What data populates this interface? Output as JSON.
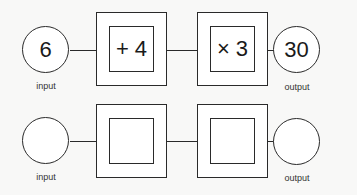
{
  "rows": [
    {
      "input": {
        "value": "6",
        "label": "input"
      },
      "operations": [
        {
          "value": "+ 4"
        },
        {
          "value": "× 3"
        }
      ],
      "output": {
        "value": "30",
        "label": "output"
      }
    },
    {
      "input": {
        "value": "",
        "label": "input"
      },
      "operations": [
        {
          "value": ""
        },
        {
          "value": ""
        }
      ],
      "output": {
        "value": "",
        "label": "output"
      }
    }
  ]
}
